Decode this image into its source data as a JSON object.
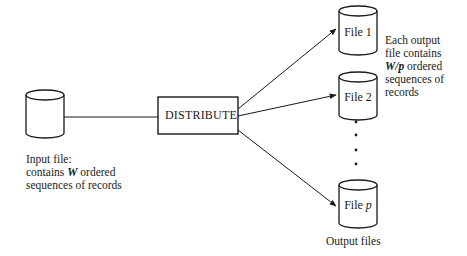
{
  "diagram": {
    "input": {
      "label_line1": "Input file:",
      "label_line2_pre": "contains ",
      "label_line2_var": "W",
      "label_line2_post": " ordered",
      "label_line3": "sequences of records"
    },
    "process": {
      "label": "DISTRIBUTE"
    },
    "outputs": [
      {
        "label": "File 1"
      },
      {
        "label": "File 2"
      },
      {
        "label_pre": "File ",
        "label_var": "p"
      }
    ],
    "ellipsis": "vertical dots",
    "output_note": {
      "line1": "Each output",
      "line2": "file contains",
      "line3_var": "W/p",
      "line3_post": " ordered",
      "line4": "sequences of",
      "line5": "records"
    },
    "output_caption": "Output files",
    "colors": {
      "stroke": "#1a1a1a",
      "background": "#ffffff"
    }
  }
}
